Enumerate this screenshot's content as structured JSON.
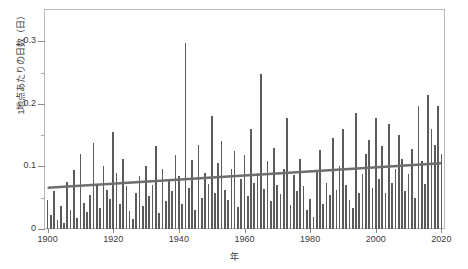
{
  "chart_data": {
    "type": "bar",
    "title": "",
    "xlabel": "年",
    "ylabel": "1地点あたりの日数（日）",
    "xlim": [
      1899.2,
      2020.8
    ],
    "ylim": [
      0,
      0.35
    ],
    "grid": false,
    "legend": null,
    "y_ticks_major": [
      0,
      0.1,
      0.2,
      0.3
    ],
    "y_tick_labels": [
      "0",
      "0.1",
      "0.2",
      "0.3"
    ],
    "y_ticks_minor": [
      0.05,
      0.15,
      0.25
    ],
    "x_ticks": [
      1900,
      1920,
      1940,
      1960,
      1980,
      2000,
      2020
    ],
    "x_tick_labels": [
      "1900",
      "1920",
      "1940",
      "1960",
      "1980",
      "2000",
      "2020"
    ],
    "bar_color": "#5b5b5b",
    "trend_color": "#6e6e6e",
    "frame_color": "#b9b9b9",
    "series": [
      {
        "name": "1地点あたりの日数（日）",
        "x": [
          1900,
          1901,
          1902,
          1903,
          1904,
          1905,
          1906,
          1907,
          1908,
          1909,
          1910,
          1911,
          1912,
          1913,
          1914,
          1915,
          1916,
          1917,
          1918,
          1919,
          1920,
          1921,
          1922,
          1923,
          1924,
          1925,
          1926,
          1927,
          1928,
          1929,
          1930,
          1931,
          1932,
          1933,
          1934,
          1935,
          1936,
          1937,
          1938,
          1939,
          1940,
          1941,
          1942,
          1943,
          1944,
          1945,
          1946,
          1947,
          1948,
          1949,
          1950,
          1951,
          1952,
          1953,
          1954,
          1955,
          1956,
          1957,
          1958,
          1959,
          1960,
          1961,
          1962,
          1963,
          1964,
          1965,
          1966,
          1967,
          1968,
          1969,
          1970,
          1971,
          1972,
          1973,
          1974,
          1975,
          1976,
          1977,
          1978,
          1979,
          1980,
          1981,
          1982,
          1983,
          1984,
          1985,
          1986,
          1987,
          1988,
          1989,
          1990,
          1991,
          1992,
          1993,
          1994,
          1995,
          1996,
          1997,
          1998,
          1999,
          2000,
          2001,
          2002,
          2003,
          2004,
          2005,
          2006,
          2007,
          2008,
          2009,
          2010,
          2011,
          2012,
          2013,
          2014,
          2015,
          2016,
          2017,
          2018,
          2019,
          2020
        ],
        "values": [
          0.047,
          0.022,
          0.06,
          0.015,
          0.036,
          0.01,
          0.075,
          0.03,
          0.095,
          0.018,
          0.12,
          0.042,
          0.027,
          0.055,
          0.138,
          0.072,
          0.033,
          0.1,
          0.062,
          0.048,
          0.155,
          0.09,
          0.04,
          0.112,
          0.068,
          0.028,
          0.016,
          0.058,
          0.085,
          0.036,
          0.1,
          0.052,
          0.07,
          0.133,
          0.025,
          0.096,
          0.044,
          0.078,
          0.06,
          0.118,
          0.085,
          0.04,
          0.298,
          0.066,
          0.11,
          0.03,
          0.135,
          0.05,
          0.09,
          0.072,
          0.18,
          0.058,
          0.105,
          0.14,
          0.062,
          0.046,
          0.096,
          0.124,
          0.035,
          0.08,
          0.118,
          0.052,
          0.16,
          0.074,
          0.09,
          0.248,
          0.064,
          0.108,
          0.044,
          0.13,
          0.07,
          0.056,
          0.096,
          0.178,
          0.038,
          0.086,
          0.06,
          0.112,
          0.068,
          0.03,
          0.048,
          0.02,
          0.094,
          0.126,
          0.04,
          0.074,
          0.055,
          0.145,
          0.062,
          0.1,
          0.16,
          0.07,
          0.046,
          0.034,
          0.186,
          0.058,
          0.088,
          0.12,
          0.142,
          0.066,
          0.178,
          0.08,
          0.132,
          0.058,
          0.168,
          0.074,
          0.096,
          0.15,
          0.112,
          0.06,
          0.088,
          0.128,
          0.05,
          0.196,
          0.108,
          0.072,
          0.214,
          0.16,
          0.134,
          0.196,
          0.12
        ]
      }
    ],
    "trend": {
      "name": "長期変化傾向",
      "x_start": 1900,
      "x_end": 2020,
      "y_start": 0.066,
      "y_end": 0.105
    }
  }
}
